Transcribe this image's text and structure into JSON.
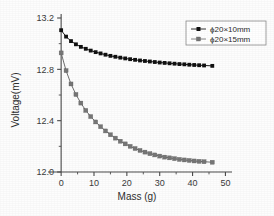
{
  "chart_data": {
    "type": "line",
    "title": "",
    "xlabel": "Mass (g)",
    "ylabel": "Voltage(mV)",
    "xlim": [
      -4,
      52
    ],
    "ylim": [
      12.0,
      13.2
    ],
    "x_ticks": [
      0,
      10,
      20,
      30,
      40,
      50
    ],
    "x_tick_labels": [
      "0",
      "10",
      "20",
      "30",
      "40",
      "50"
    ],
    "x_minor_ticks": [
      5,
      15,
      25,
      35,
      45
    ],
    "y_ticks": [
      12.0,
      12.4,
      12.8,
      13.2
    ],
    "y_tick_labels": [
      "12.0",
      "12.4",
      "12.8",
      "13.2"
    ],
    "y_minor_ticks": [
      12.2,
      12.6,
      13.0
    ],
    "grid": false,
    "legend_position": "top-right",
    "marker": "square",
    "series": [
      {
        "name": "ϕ20×10mm",
        "color": "#111111",
        "x": [
          0,
          1.5,
          3,
          4.5,
          6,
          7.5,
          9,
          10.5,
          12,
          13.5,
          15,
          16.5,
          18,
          19.5,
          21,
          22.5,
          24,
          25.5,
          27,
          28.5,
          30,
          31.5,
          33,
          34.5,
          36,
          37.5,
          39,
          40.5,
          42,
          43.5,
          46
        ],
        "y": [
          13.105,
          13.055,
          13.02,
          12.995,
          12.975,
          12.96,
          12.946,
          12.934,
          12.924,
          12.914,
          12.905,
          12.898,
          12.891,
          12.885,
          12.879,
          12.874,
          12.869,
          12.865,
          12.861,
          12.857,
          12.853,
          12.85,
          12.847,
          12.844,
          12.841,
          12.839,
          12.836,
          12.834,
          12.832,
          12.83,
          12.827
        ]
      },
      {
        "name": "ϕ20×15mm",
        "color": "#777777",
        "x": [
          0,
          1.5,
          3,
          4.5,
          6,
          7.5,
          9,
          10.5,
          12,
          13.5,
          15,
          16.5,
          18,
          19.5,
          21,
          22.5,
          24,
          25.5,
          27,
          28.5,
          30,
          31.5,
          33,
          34.5,
          36,
          37.5,
          39,
          40.5,
          42,
          43.5,
          46
        ],
        "y": [
          12.928,
          12.79,
          12.686,
          12.604,
          12.537,
          12.48,
          12.432,
          12.39,
          12.353,
          12.32,
          12.29,
          12.264,
          12.24,
          12.219,
          12.2,
          12.183,
          12.168,
          12.155,
          12.143,
          12.133,
          12.124,
          12.116,
          12.11,
          12.104,
          12.098,
          12.094,
          12.09,
          12.086,
          12.083,
          12.08,
          12.076
        ]
      }
    ],
    "legend": [
      {
        "label": "ϕ20×10mm",
        "color": "#111111"
      },
      {
        "label": "ϕ20×15mm",
        "color": "#777777"
      }
    ]
  }
}
